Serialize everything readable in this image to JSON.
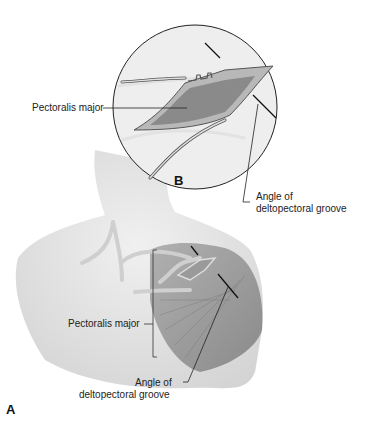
{
  "figure": {
    "panels": [
      {
        "id": "A",
        "label": "A"
      },
      {
        "id": "B",
        "label": "B"
      }
    ],
    "inset_B": {
      "labels": {
        "pectoralis": "Pectoralis major",
        "groove_line1": "Angle of",
        "groove_line2": "deltopectoral groove"
      }
    },
    "main_A": {
      "labels": {
        "pectoralis": "Pectoralis major",
        "groove_line1": "Angle of",
        "groove_line2": "deltopectoral groove"
      }
    },
    "colors": {
      "skin": "#e6e6e6",
      "muscle": "#8e8e8e",
      "vessel": "#cfcfcf",
      "line": "#111111"
    }
  }
}
